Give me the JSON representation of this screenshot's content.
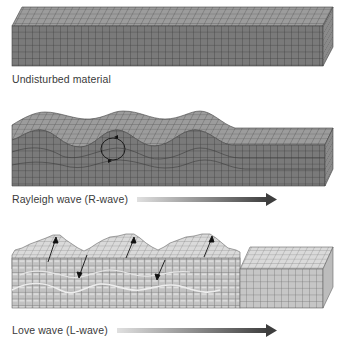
{
  "panels": [
    {
      "id": "undisturbed",
      "label": "Undisturbed material",
      "has_arrow": false
    },
    {
      "id": "rayleigh",
      "label": "Rayleigh wave (R-wave)",
      "has_arrow": true,
      "motion_marker": "elliptical-orbit-circle"
    },
    {
      "id": "love",
      "label": "Love wave (L-wave)",
      "has_arrow": true,
      "motion_marker": "side-to-side-arrows"
    }
  ],
  "colors": {
    "front_face_dark": "#7a7a7a",
    "top_face_dark": "#9c9c9c",
    "side_face_dark": "#8a8a8a",
    "grid_dark": "#3c3c3c",
    "front_face_light": "#c6c6c6",
    "top_face_light": "#dadada",
    "grid_light": "#6e6e6e",
    "arrow_start": "#e0e0e0",
    "arrow_end": "#3e3e3e",
    "label_text": "#3a3a3a"
  }
}
